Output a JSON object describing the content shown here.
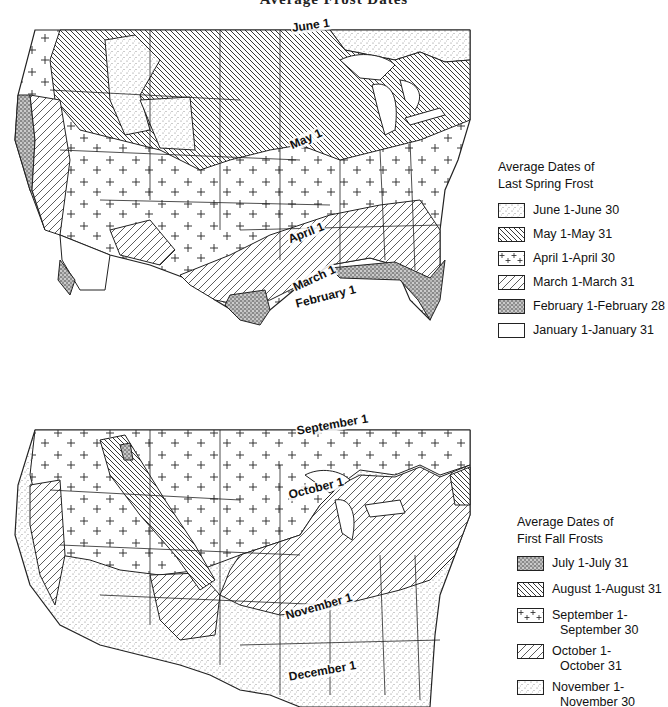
{
  "page": {
    "title": "Average Frost Dates"
  },
  "spring_map": {
    "labels": [
      {
        "text": "June 1",
        "x": 291,
        "y": 28,
        "rot": -8
      },
      {
        "text": "May 1",
        "x": 290,
        "y": 146,
        "rot": -24
      },
      {
        "text": "April 1",
        "x": 288,
        "y": 240,
        "rot": -22
      },
      {
        "text": "March 1",
        "x": 293,
        "y": 286,
        "rot": -25
      },
      {
        "text": "February 1",
        "x": 295,
        "y": 303,
        "rot": -14
      }
    ],
    "legend": {
      "title_line1": "Average Dates of",
      "title_line2": "Last Spring Frost",
      "items": [
        {
          "pattern": "fine-stipple",
          "label": "June 1-June 30"
        },
        {
          "pattern": "dense-backslash",
          "label": "May 1-May 31"
        },
        {
          "pattern": "crosses",
          "label": "April 1-April 30"
        },
        {
          "pattern": "forward-slash",
          "label": "March 1-March 31"
        },
        {
          "pattern": "heavy-stipple",
          "label": "February 1-February 28"
        },
        {
          "pattern": "blank",
          "label": "January 1-January 31"
        }
      ]
    }
  },
  "fall_map": {
    "labels": [
      {
        "text": "September 1",
        "x": 296,
        "y": 428,
        "rot": -10
      },
      {
        "text": "October 1",
        "x": 288,
        "y": 492,
        "rot": -14
      },
      {
        "text": "November 1",
        "x": 285,
        "y": 613,
        "rot": -16
      },
      {
        "text": "December 1",
        "x": 288,
        "y": 674,
        "rot": -10
      }
    ],
    "legend": {
      "title_line1": "Average Dates of",
      "title_line2": "First Fall Frosts",
      "items": [
        {
          "pattern": "heavy-stipple",
          "label_line1": "July 1-July 31",
          "label_line2": ""
        },
        {
          "pattern": "dense-backslash",
          "label_line1": "August 1-August 31",
          "label_line2": ""
        },
        {
          "pattern": "crosses",
          "label_line1": "September 1-",
          "label_line2": "September 30"
        },
        {
          "pattern": "forward-slash",
          "label_line1": "October 1-",
          "label_line2": "October 31"
        },
        {
          "pattern": "fine-stipple",
          "label_line1": "November 1-",
          "label_line2": "November 30"
        }
      ]
    }
  }
}
